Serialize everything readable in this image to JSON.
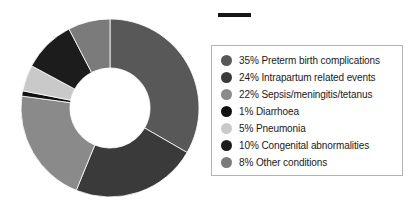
{
  "chart_data": {
    "type": "pie",
    "variant": "donut",
    "title": "",
    "subtitle": "",
    "xlabel": "",
    "ylabel": "",
    "units": "percent",
    "total": 105,
    "start_angle_deg": 0,
    "direction": "clockwise",
    "inner_radius_ratio": 0.45,
    "legend_position": "right",
    "grid": false,
    "categories": [
      "Preterm birth complications",
      "Intrapartum related events",
      "Sepsis/meningitis/tetanus",
      "Diarrhoea",
      "Pneumonia",
      "Congenital abnormalities",
      "Other conditions"
    ],
    "values": [
      35,
      24,
      22,
      1,
      5,
      10,
      8
    ],
    "value_labels": [
      "35%",
      "24%",
      "22%",
      "1%",
      "5%",
      "10%",
      "8%"
    ],
    "colors": [
      "#585858",
      "#3a3a3a",
      "#8a8a8a",
      "#111111",
      "#c9c9c9",
      "#1c1c1c",
      "#7b7b7b"
    ],
    "slices": [
      {
        "label": "Preterm birth complications",
        "value": 35,
        "value_label": "35%",
        "color": "#585858"
      },
      {
        "label": "Intrapartum related events",
        "value": 24,
        "value_label": "24%",
        "color": "#3a3a3a"
      },
      {
        "label": "Sepsis/meningitis/tetanus",
        "value": 22,
        "value_label": "22%",
        "color": "#8a8a8a"
      },
      {
        "label": "Diarrhoea",
        "value": 1,
        "value_label": "1%",
        "color": "#111111"
      },
      {
        "label": "Pneumonia",
        "value": 5,
        "value_label": "5%",
        "color": "#c9c9c9"
      },
      {
        "label": "Congenital abnormalities",
        "value": 10,
        "value_label": "10%",
        "color": "#1c1c1c"
      },
      {
        "label": "Other conditions",
        "value": 8,
        "value_label": "8%",
        "color": "#7b7b7b"
      }
    ]
  },
  "legend": {
    "entries": [
      {
        "text": "35% Preterm birth complications",
        "color": "#585858"
      },
      {
        "text": "24% Intrapartum related events",
        "color": "#3a3a3a"
      },
      {
        "text": "22% Sepsis/meningitis/tetanus",
        "color": "#8a8a8a"
      },
      {
        "text": "1% Diarrhoea",
        "color": "#111111"
      },
      {
        "text": "5% Pneumonia",
        "color": "#c9c9c9"
      },
      {
        "text": "10% Congenital abnormalities",
        "color": "#1c1c1c"
      },
      {
        "text": "8% Other conditions",
        "color": "#7b7b7b"
      }
    ],
    "border_color": "#b3b3b3"
  },
  "marks": {
    "dash_color": "#161616"
  }
}
